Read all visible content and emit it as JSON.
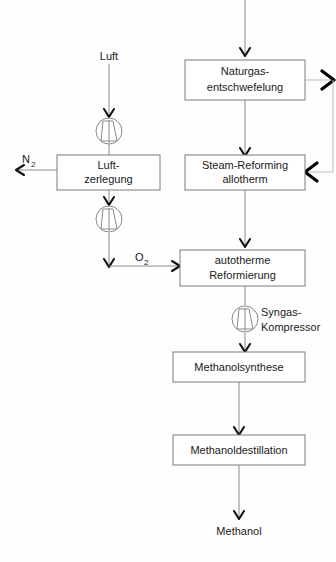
{
  "diagram": {
    "boxes": [
      {
        "id": "naturgas",
        "label_line1": "Naturgas-",
        "label_line2": "entschwefelung"
      },
      {
        "id": "luftzerlegung",
        "label_line1": "Luft-",
        "label_line2": "zerlegung"
      },
      {
        "id": "steamreforming",
        "label_line1": "Steam-Reforming",
        "label_line2": "allotherm"
      },
      {
        "id": "autotherm",
        "label_line1": "autotherme",
        "label_line2": "Reformierung"
      },
      {
        "id": "methanolsynthese",
        "label_line1": "Methanolsynthese",
        "label_line2": ""
      },
      {
        "id": "methanoldestillation",
        "label_line1": "Methanoldestillation",
        "label_line2": ""
      }
    ],
    "stream_labels": {
      "luft": "Luft",
      "nitrogen_main": "N",
      "nitrogen_sub": "2",
      "oxygen_main": "O",
      "oxygen_sub": "2",
      "syngas_line1": "Syngas-",
      "syngas_line2": "Kompressor",
      "methanol_product": "Methanol"
    },
    "equipment_icons": [
      {
        "id": "air-compressor",
        "name": "compressor-icon"
      },
      {
        "id": "oxygen-compressor",
        "name": "compressor-icon"
      },
      {
        "id": "syngas-compressor",
        "name": "compressor-icon"
      }
    ],
    "colors": {
      "box_stroke": "#7a7a7a",
      "line": "#8a8a8a",
      "arrow": "#111111",
      "text": "#1a1a1a",
      "background": "#fefefe"
    }
  }
}
